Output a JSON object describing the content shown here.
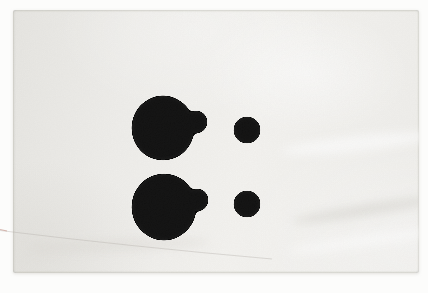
{
  "meta": {
    "width": 428,
    "height": 293
  },
  "colors": {
    "backdrop": "#fcfcfb",
    "paper": "#f0efec",
    "paper-dark": "#e8e7e3",
    "paper-light": "#f5f4f1",
    "ink": "#0a0a0a",
    "crease": "#b5b0aa",
    "fiber": "#c89b92"
  },
  "paper": {
    "x": 13,
    "y": 10,
    "w": 406,
    "h": 263
  },
  "blots": {
    "large_top": {
      "cx": 163,
      "cy": 128,
      "rx": 31,
      "ry": 32,
      "lobe_cx": 196,
      "lobe_cy": 122,
      "lobe_r": 11
    },
    "large_bottom": {
      "cx": 164,
      "cy": 207,
      "rx": 32,
      "ry": 33,
      "lobe_cx": 197,
      "lobe_cy": 200,
      "lobe_r": 11
    },
    "small_top": {
      "cx": 247,
      "cy": 130,
      "r": 13
    },
    "small_bottom": {
      "cx": 247,
      "cy": 204,
      "r": 13
    }
  },
  "crease": {
    "path": "M 0 230.5 Q 130 246.5 272 259",
    "width": 0.8,
    "opacity": 0.5
  },
  "fiber_speck": {
    "path": "M 0 229.5 L 7 231",
    "width": 1.2,
    "opacity": 0.7
  }
}
